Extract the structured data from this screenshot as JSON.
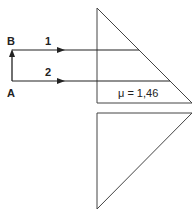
{
  "diagram": {
    "labels": {
      "point_b": "B",
      "point_a": "A",
      "ray_1": "1",
      "ray_2": "2",
      "refractive_index": "μ = 1,46"
    },
    "colors": {
      "line": "#333333",
      "background": "#ffffff"
    },
    "elements": {
      "upper_prism": "right-angle prism, hypotenuse facing lower-right",
      "lower_prism": "right-angle prism, hypotenuse facing upper-right",
      "rays": [
        "ray 1 from B",
        "ray 2 from A"
      ],
      "arrow_a_to_b": "vertical arrow from A up to B"
    }
  }
}
